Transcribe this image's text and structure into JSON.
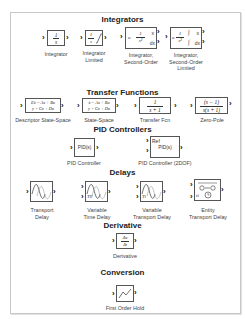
{
  "sections": [
    {
      "title": "Integrators",
      "blocks": [
        {
          "label": "Integrator",
          "content": "1/s"
        },
        {
          "label": "Integrator Limited",
          "label_lines": [
            "Integrator",
            "Limited"
          ],
          "content": "1/s with limit"
        },
        {
          "label": "Integrator, Second-Order",
          "label_lines": [
            "Integrator,",
            "Second-Order"
          ],
          "content": "1/s²",
          "ports_in": [
            "u"
          ],
          "ports_out": [
            "x",
            "dx"
          ]
        },
        {
          "label": "Integrator, Second-Order Limited",
          "label_lines": [
            "Integrator,",
            "Second-Order",
            "Limited"
          ],
          "content": "1/s² limited",
          "ports_in": [
            "u"
          ],
          "ports_out": [
            "x",
            "dx"
          ]
        }
      ]
    },
    {
      "title": "Transfer Functions",
      "blocks": [
        {
          "label": "Descriptor State-Space",
          "content_lines": [
            "Eẋ = Ax + Bu",
            "y = Cx + Du"
          ]
        },
        {
          "label": "State-Space",
          "content_lines": [
            "ẋ = Ax + Bu",
            "y = Cx + Du"
          ]
        },
        {
          "label": "Transfer Fcn",
          "num": "1",
          "den": "s + 1"
        },
        {
          "label": "Zero-Pole",
          "num": "(s − 1)",
          "den": "s(s + 1)"
        }
      ]
    },
    {
      "title": "PID Controllers",
      "blocks": [
        {
          "label": "PID Controller",
          "content": "PID(s)"
        },
        {
          "label": "PID Controller (2DOF)",
          "content": "PID(s)",
          "ports_in": [
            "Ref",
            ""
          ]
        }
      ]
    },
    {
      "title": "Delays",
      "blocks": [
        {
          "label": "Transport Delay",
          "label_lines": [
            "Transport",
            "Delay"
          ]
        },
        {
          "label": "Variable Time Delay",
          "label_lines": [
            "Variable",
            "Time Delay"
          ],
          "ports_in": [
            "",
            "T0"
          ]
        },
        {
          "label": "Variable Transport Delay",
          "label_lines": [
            "Variable",
            "Transport Delay"
          ],
          "ports_in": [
            "",
            "Ti"
          ]
        },
        {
          "label": "Entity Transport Delay",
          "label_lines": [
            "Entity",
            "Transport Delay"
          ],
          "ports_in": [
            "",
            "ti"
          ]
        }
      ]
    },
    {
      "title": "Derivative",
      "blocks": [
        {
          "label": "Derivative",
          "num": "Δu",
          "den": "Δt"
        }
      ]
    },
    {
      "title": "Conversion",
      "blocks": [
        {
          "label": "First Order Hold"
        }
      ]
    }
  ],
  "glyphs": {
    "port_arrow": "›",
    "one": "1",
    "s": "s",
    "s2": "s²",
    "u": "u",
    "x": "x",
    "dx": "dx",
    "int": "∫"
  },
  "colors": {
    "frame_border": "#c8c8c8",
    "block_border": "#555555",
    "text": "#333333"
  }
}
